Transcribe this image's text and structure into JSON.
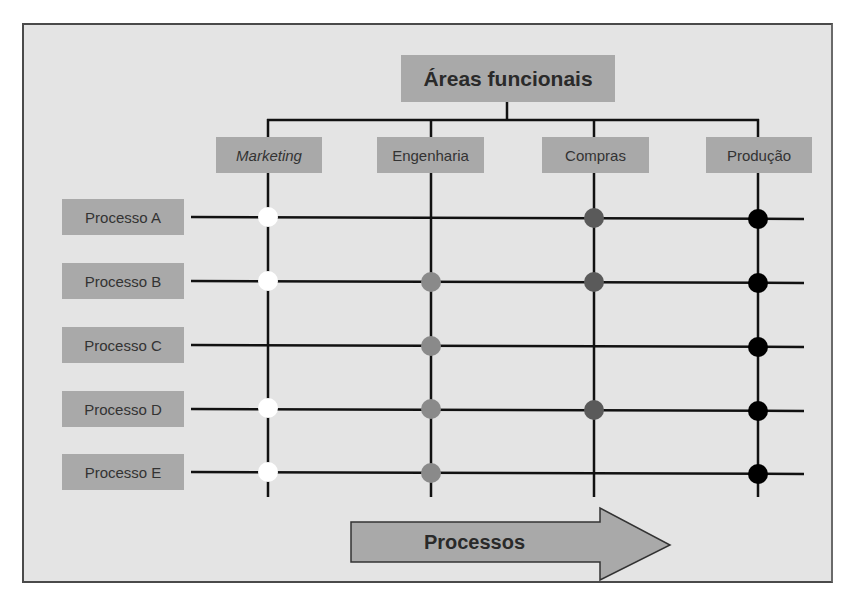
{
  "diagram": {
    "title": "Áreas funcionais",
    "areas": [
      {
        "label": "Marketing",
        "italic": true,
        "x": 268
      },
      {
        "label": "Engenharia",
        "italic": false,
        "x": 431
      },
      {
        "label": "Compras",
        "italic": false,
        "x": 594
      },
      {
        "label": "Produção",
        "italic": false,
        "x": 758
      }
    ],
    "processes": [
      {
        "label": "Processo A",
        "y": 217,
        "markers": [
          "white",
          null,
          "darkgray",
          "black"
        ]
      },
      {
        "label": "Processo B",
        "y": 282,
        "markers": [
          "white",
          "gray",
          "darkgray",
          "black"
        ]
      },
      {
        "label": "Processo C",
        "y": 346,
        "markers": [
          null,
          "gray",
          null,
          "black"
        ]
      },
      {
        "label": "Processo D",
        "y": 410,
        "markers": [
          "white",
          "gray",
          "darkgray",
          "black"
        ]
      },
      {
        "label": "Processo E",
        "y": 473,
        "markers": [
          "white",
          "gray",
          null,
          "black"
        ]
      }
    ],
    "arrow_label": "Processos",
    "colors": {
      "white": "#ffffff",
      "gray": "#8a8a8a",
      "darkgray": "#5a5a5a",
      "black": "#000000",
      "box": "#a9a9a9",
      "background": "#e4e4e4"
    }
  }
}
